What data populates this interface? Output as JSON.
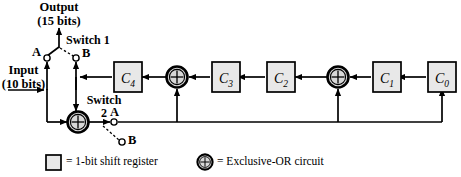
{
  "figure": {
    "type": "lfsr-crc-encoder-diagram",
    "title_text": ""
  },
  "labels": {
    "output": "Output",
    "output_bits": "(15 bits)",
    "input": "Input",
    "input_bits": "(10 bits)",
    "switch1": "Switch 1",
    "switch2_line1": "Switch",
    "switch2_line2": "2",
    "switch1_contact_a": "A",
    "switch1_contact_b": "B",
    "switch2_contact_a": "A",
    "switch2_contact_b": "B"
  },
  "registers": [
    {
      "name": "C",
      "sub": "4",
      "x": 114,
      "y": 62
    },
    {
      "name": "C",
      "sub": "3",
      "x": 212,
      "y": 62
    },
    {
      "name": "C",
      "sub": "2",
      "x": 267,
      "y": 62
    },
    {
      "name": "C",
      "sub": "1",
      "x": 373,
      "y": 62
    },
    {
      "name": "C",
      "sub": "0",
      "x": 428,
      "y": 62
    }
  ],
  "xor_gates": [
    {
      "id": "xor-input",
      "cx": 78,
      "cy": 122
    },
    {
      "id": "xor-c4-c3",
      "cx": 177,
      "cy": 77
    },
    {
      "id": "xor-c2-c1",
      "cx": 338,
      "cy": 77
    }
  ],
  "legend": [
    {
      "symbol": "square",
      "text": "= 1-bit shift register"
    },
    {
      "symbol": "xor-circle",
      "text": "= Exclusive-OR circuit"
    }
  ],
  "colors": {
    "line": "#000000",
    "register_fill": "#e8e8e8",
    "register_stroke": "#000000",
    "xor_fill": "#d8d8d8",
    "background": "#ffffff"
  },
  "switch_states": {
    "switch1_position": "A",
    "switch2_position": "A"
  }
}
